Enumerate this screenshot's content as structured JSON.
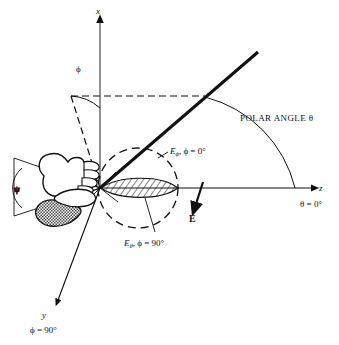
{
  "figure": {
    "type": "technical-diagram"
  },
  "axes": {
    "x": {
      "label": "x"
    },
    "y": {
      "label": "y",
      "sublabel": "ϕ = 90°"
    },
    "z": {
      "label": "z",
      "sublabel": "θ = 0°"
    }
  },
  "angles": {
    "phi_arc_label": "ϕ",
    "psi_arc_label": "ψ",
    "polar_angle_label": "POLAR ANGLE θ"
  },
  "field": {
    "e_vector_label": "E",
    "e_phi_label": {
      "base": "E",
      "sub": "ϕ",
      "rest": ", ϕ = 0°"
    },
    "e_theta_label": {
      "base": "E",
      "sub": "θ",
      "rest": ", ϕ = 90°"
    }
  },
  "colors": {
    "ink": "#111111",
    "paper": "#fefefe",
    "hatch": "#222222"
  }
}
